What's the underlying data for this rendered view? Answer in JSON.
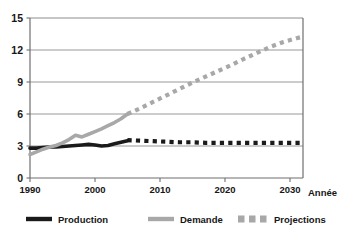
{
  "chart_data": {
    "type": "line",
    "title": "",
    "xlabel": "Année",
    "ylabel": "",
    "xlim": [
      1990,
      2032
    ],
    "ylim": [
      0,
      15
    ],
    "grid": true,
    "legend_position": "bottom",
    "xticks": [
      "1990",
      "2000",
      "2010",
      "2020",
      "2030"
    ],
    "xtick_values": [
      1990,
      2000,
      2010,
      2020,
      2030
    ],
    "yticks": [
      "0",
      "3",
      "6",
      "9",
      "12",
      "15"
    ],
    "ytick_values": [
      0,
      3,
      6,
      9,
      12,
      15
    ],
    "colors": {
      "production": "#1a1a1a",
      "demande": "#a8a8a8",
      "projections": "#a8a8a8",
      "grid": "#8c8c8c",
      "axis": "#6f6f6f",
      "background": "#ffffff"
    },
    "series": [
      {
        "name": "Production",
        "style": "solid",
        "color": "#1a1a1a",
        "x": [
          1990,
          1991,
          1992,
          1993,
          1994,
          1995,
          1996,
          1997,
          1998,
          1999,
          2000,
          2001,
          2002,
          2003,
          2004,
          2005
        ],
        "values": [
          2.8,
          2.8,
          2.85,
          2.9,
          2.9,
          2.95,
          3.0,
          3.05,
          3.1,
          3.15,
          3.1,
          3.0,
          3.05,
          3.2,
          3.35,
          3.5
        ]
      },
      {
        "name": "Demande",
        "style": "solid",
        "color": "#a8a8a8",
        "x": [
          1990,
          1991,
          1992,
          1993,
          1994,
          1995,
          1996,
          1997,
          1998,
          1999,
          2000,
          2001,
          2002,
          2003,
          2004,
          2005
        ],
        "values": [
          2.2,
          2.45,
          2.7,
          2.9,
          3.05,
          3.3,
          3.6,
          4.0,
          3.85,
          4.1,
          4.35,
          4.6,
          4.9,
          5.2,
          5.55,
          6.0
        ]
      },
      {
        "name": "Projections Production",
        "style": "dashed",
        "color": "#1a1a1a",
        "x": [
          2005,
          2007,
          2009,
          2011,
          2013,
          2015,
          2017,
          2019,
          2021,
          2023,
          2025,
          2027,
          2029,
          2031,
          2032
        ],
        "values": [
          3.55,
          3.5,
          3.45,
          3.4,
          3.35,
          3.35,
          3.3,
          3.3,
          3.3,
          3.3,
          3.3,
          3.3,
          3.3,
          3.3,
          3.3
        ]
      },
      {
        "name": "Projections Demande",
        "style": "dashed",
        "color": "#a8a8a8",
        "x": [
          2005,
          2007,
          2009,
          2011,
          2013,
          2015,
          2017,
          2019,
          2021,
          2023,
          2025,
          2027,
          2029,
          2031,
          2032
        ],
        "values": [
          6.0,
          6.55,
          7.15,
          7.75,
          8.35,
          8.95,
          9.5,
          10.05,
          10.6,
          11.2,
          11.75,
          12.3,
          12.75,
          13.1,
          13.25
        ]
      }
    ],
    "legend": [
      {
        "label": "Production",
        "marker": "solid-line",
        "color": "#1a1a1a"
      },
      {
        "label": "Demande",
        "marker": "solid-line",
        "color": "#a8a8a8"
      },
      {
        "label": "Projections",
        "marker": "dashed-squares",
        "color": "#a8a8a8"
      }
    ],
    "clipped_top_text": "· ·"
  }
}
